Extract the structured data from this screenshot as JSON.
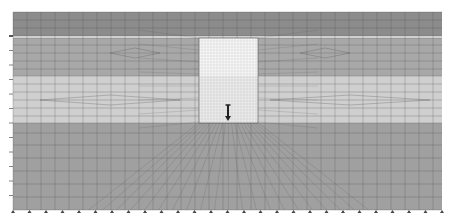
{
  "diagram": {
    "type": "finite-element-mesh",
    "domain": {
      "x0": 13,
      "x1": 442,
      "y0": 12,
      "y1": 210
    },
    "layers": [
      {
        "name": "top-layer",
        "y0": 12,
        "y1": 36,
        "color": "#8c8c8c"
      },
      {
        "name": "interface-strip",
        "y0": 36,
        "y1": 38,
        "color": "#e6e6e6"
      },
      {
        "name": "layer-2",
        "y0": 38,
        "y1": 76,
        "color": "#a8a8a8"
      },
      {
        "name": "layer-3",
        "y0": 76,
        "y1": 123,
        "color": "#cfcfcf"
      },
      {
        "name": "bottom-layer",
        "y0": 123,
        "y1": 210,
        "color": "#a0a0a0"
      }
    ],
    "block": {
      "x0": 199,
      "x1": 258,
      "y0": 38,
      "y1": 123,
      "upper_color": "#f8f8f8",
      "lower_color": "#ececec",
      "split_y": 76
    },
    "load_arrow": {
      "x": 228,
      "y0": 105,
      "y1": 121,
      "color": "#222222"
    },
    "mesh_color": "#555555",
    "bottom_supports_count": 27,
    "left_ticks_count": 12
  }
}
